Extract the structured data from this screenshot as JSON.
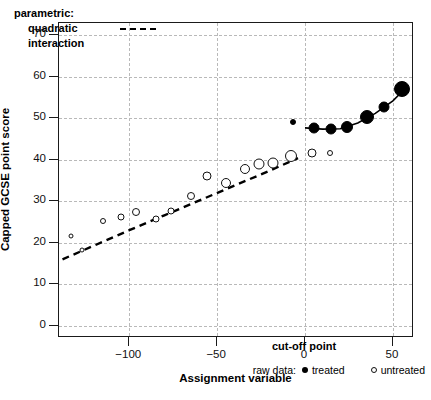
{
  "chart_data": {
    "type": "scatter",
    "title": "",
    "xlabel": "Assignment variable",
    "ylabel": "Capped GCSE point score",
    "xlim": [
      -140,
      62
    ],
    "ylim": [
      -3,
      73
    ],
    "xticks": [
      -100,
      -50,
      0,
      50
    ],
    "xticklabels": [
      "−100",
      "−50",
      "0",
      "50"
    ],
    "yticks": [
      0,
      10,
      20,
      30,
      40,
      50,
      60,
      70
    ],
    "yticklabels": [
      "0",
      "10",
      "20",
      "30",
      "40",
      "50",
      "60",
      "70"
    ],
    "grid": true,
    "grid_style": "dotted-grey",
    "cutoff": 0,
    "cutoff_label": "cut-off point",
    "legend_top": {
      "line1": "parametric:",
      "line2": "quadratic",
      "line3": "interaction",
      "sample": "dashed-line"
    },
    "legend_bottom": {
      "title": "raw data:",
      "treated_label": "treated",
      "untreated_label": "untreated",
      "treated_marker": "filled-circle",
      "untreated_marker": "open-circle"
    },
    "series": [
      {
        "name": "untreated",
        "marker": "open-circle",
        "points": [
          {
            "x": -133,
            "y": 21.6,
            "size": 5
          },
          {
            "x": -127,
            "y": 18.3,
            "size": 5
          },
          {
            "x": -115,
            "y": 25.3,
            "size": 6
          },
          {
            "x": -105,
            "y": 26.3,
            "size": 7
          },
          {
            "x": -96,
            "y": 27.4,
            "size": 8
          },
          {
            "x": -85,
            "y": 25.6,
            "size": 7
          },
          {
            "x": -76,
            "y": 27.7,
            "size": 7
          },
          {
            "x": -65,
            "y": 31.3,
            "size": 8
          },
          {
            "x": -56,
            "y": 36.0,
            "size": 9
          },
          {
            "x": -45,
            "y": 34.4,
            "size": 10
          },
          {
            "x": -34,
            "y": 37.8,
            "size": 10
          },
          {
            "x": -26,
            "y": 39.0,
            "size": 11
          },
          {
            "x": -18,
            "y": 39.3,
            "size": 11
          },
          {
            "x": -8,
            "y": 40.8,
            "size": 12
          },
          {
            "x": 4,
            "y": 41.6,
            "size": 9
          },
          {
            "x": 14,
            "y": 41.6,
            "size": 6
          }
        ]
      },
      {
        "name": "treated",
        "marker": "filled-circle",
        "points": [
          {
            "x": -7,
            "y": 49.1,
            "size": 6
          },
          {
            "x": 5,
            "y": 47.7,
            "size": 11
          },
          {
            "x": 15,
            "y": 47.4,
            "size": 11
          },
          {
            "x": 24,
            "y": 47.8,
            "size": 12
          },
          {
            "x": 35,
            "y": 50.4,
            "size": 14
          },
          {
            "x": 45,
            "y": 52.8,
            "size": 11
          },
          {
            "x": 55,
            "y": 57.0,
            "size": 16
          }
        ]
      }
    ],
    "fit_lines": [
      {
        "name": "parametric-quadratic-interaction-left",
        "style": "dashed",
        "points": [
          {
            "x": -138,
            "y": 16.0
          },
          {
            "x": -120,
            "y": 19.3
          },
          {
            "x": -100,
            "y": 23.0
          },
          {
            "x": -80,
            "y": 26.6
          },
          {
            "x": -60,
            "y": 30.2
          },
          {
            "x": -40,
            "y": 33.8
          },
          {
            "x": -20,
            "y": 37.4
          },
          {
            "x": -4,
            "y": 40.4
          }
        ]
      },
      {
        "name": "parametric-quadratic-interaction-right",
        "style": "solid",
        "points": [
          {
            "x": 0,
            "y": 47.7
          },
          {
            "x": 10,
            "y": 47.4
          },
          {
            "x": 20,
            "y": 47.5
          },
          {
            "x": 30,
            "y": 48.9
          },
          {
            "x": 40,
            "y": 51.2
          },
          {
            "x": 50,
            "y": 54.2
          },
          {
            "x": 57,
            "y": 57.2
          }
        ]
      }
    ]
  }
}
